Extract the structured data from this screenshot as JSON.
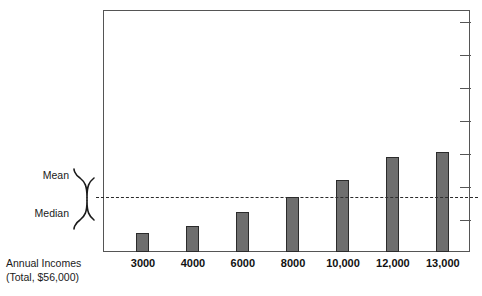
{
  "chart_data": {
    "type": "bar",
    "title": "",
    "subtitle": "",
    "xlabel": "Annual Incomes (Total, $56,000)",
    "ylabel": "",
    "categories": [
      "3000",
      "4000",
      "6000",
      "8000",
      "10,000",
      "12,000",
      "13,000"
    ],
    "values": [
      3000,
      4000,
      6000,
      8000,
      10000,
      12000,
      13000
    ],
    "bar_pixel_heights": [
      19,
      26,
      40,
      55,
      72,
      95,
      100
    ],
    "ylim": [
      0,
      14000
    ],
    "grid": false,
    "legend_position": "none",
    "bar_color": "#6e6e6e",
    "bar_edge_color": "#2b2b2b",
    "annotations": [
      {
        "name": "mean-median-line",
        "type": "horizontal-dashed-line",
        "labels": [
          "Mean",
          "Median"
        ],
        "value": 8000,
        "note": "Mean and Median coincide at the same level"
      }
    ],
    "right_axis_tick_count": 7,
    "total_label": "Total, $56,000"
  },
  "axis": {
    "caption_line1": "Annual Incomes",
    "caption_line2": "(Total, $56,000)"
  },
  "annotation": {
    "mean_label": "Mean",
    "median_label": "Median"
  },
  "xticks": [
    {
      "label": "3000",
      "center_pct": 10.9
    },
    {
      "label": "4000",
      "center_pct": 24.5
    },
    {
      "label": "6000",
      "center_pct": 38.1
    },
    {
      "label": "8000",
      "center_pct": 51.8
    },
    {
      "label": "10,000",
      "center_pct": 65.4
    },
    {
      "label": "12,000",
      "center_pct": 79.0
    },
    {
      "label": "13,000",
      "center_pct": 92.6
    }
  ],
  "bars": [
    {
      "label": "3000",
      "left_px": 33,
      "height_px": 19
    },
    {
      "label": "4000",
      "left_px": 83,
      "height_px": 26
    },
    {
      "label": "6000",
      "left_px": 133,
      "height_px": 40
    },
    {
      "label": "8000",
      "left_px": 183,
      "height_px": 55
    },
    {
      "label": "10,000",
      "left_px": 233,
      "height_px": 72
    },
    {
      "label": "12,000",
      "left_px": 283,
      "height_px": 95
    },
    {
      "label": "13,000",
      "left_px": 333,
      "height_px": 100
    }
  ],
  "right_ticks": [
    12,
    45,
    78,
    111,
    144,
    177,
    210
  ],
  "colors": {
    "bar_fill": "#6e6e6e",
    "bar_edge": "#2b2b2b",
    "frame": "#555555",
    "text": "#1a1a1a"
  }
}
